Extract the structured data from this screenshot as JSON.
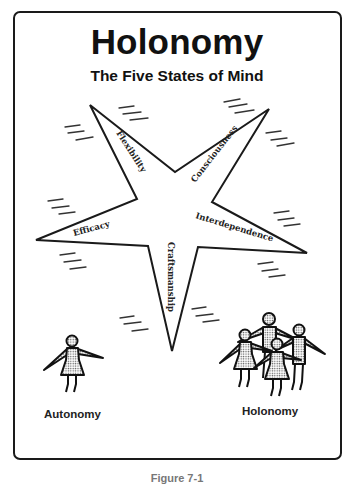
{
  "diagram": {
    "title": "Holonomy",
    "subtitle": "The Five States of Mind",
    "star": {
      "points": [
        {
          "name": "top-left",
          "label": "Flexibility"
        },
        {
          "name": "top-right",
          "label": "Consciousness"
        },
        {
          "name": "right",
          "label": "Interdependence"
        },
        {
          "name": "bottom",
          "label": "Craftsmanship"
        },
        {
          "name": "left",
          "label": "Efficacy"
        }
      ],
      "stroke_color": "#1a1a1a"
    },
    "groups": [
      {
        "label": "Autonomy",
        "figure_count": 1
      },
      {
        "label": "Holonomy",
        "figure_count": 4
      }
    ],
    "caption": "Figure 7-1"
  }
}
